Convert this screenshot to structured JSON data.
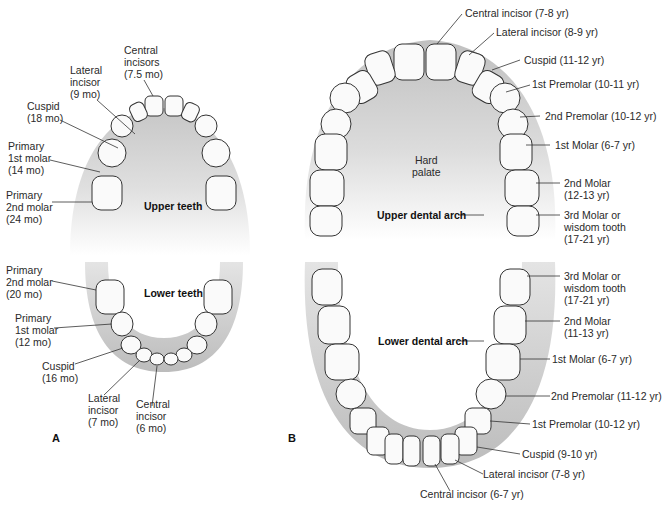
{
  "panel_a": {
    "letter": "A",
    "upper_title": "Upper teeth",
    "lower_title": "Lower teeth",
    "upper_labels": [
      {
        "name": "Central\nincisors\n(7.5 mo)"
      },
      {
        "name": "Lateral\nincisor\n(9 mo)"
      },
      {
        "name": "Cuspid\n(18 mo)"
      },
      {
        "name": "Primary\n1st molar\n(14 mo)"
      },
      {
        "name": "Primary\n2nd molar\n(24 mo)"
      }
    ],
    "lower_labels": [
      {
        "name": "Primary\n2nd molar\n(20 mo)"
      },
      {
        "name": "Primary\n1st molar\n(12 mo)"
      },
      {
        "name": "Cuspid\n(16 mo)"
      },
      {
        "name": "Lateral\nincisor\n(7 mo)"
      },
      {
        "name": "Central\nincisor\n(6 mo)"
      }
    ]
  },
  "panel_b": {
    "letter": "B",
    "hard_palate": "Hard\npalate",
    "upper_title": "Upper dental arch",
    "lower_title": "Lower dental arch",
    "upper_labels": [
      {
        "name": "Central incisor (7-8 yr)"
      },
      {
        "name": "Lateral incisor (8-9 yr)"
      },
      {
        "name": "Cuspid (11-12 yr)"
      },
      {
        "name": "1st Premolar (10-11 yr)"
      },
      {
        "name": "2nd Premolar (10-12 yr)"
      },
      {
        "name": "1st Molar (6-7 yr)"
      },
      {
        "name": "2nd Molar\n(12-13 yr)"
      },
      {
        "name": "3rd Molar or\nwisdom tooth\n(17-21 yr)"
      }
    ],
    "lower_labels": [
      {
        "name": "3rd Molar or\nwisdom tooth\n(17-21 yr)"
      },
      {
        "name": "2nd Molar\n(11-13 yr)"
      },
      {
        "name": "1st Molar (6-7 yr)"
      },
      {
        "name": "2nd Premolar (11-12 yr)"
      },
      {
        "name": "1st Premolar (10-12 yr)"
      },
      {
        "name": "Cuspid (9-10 yr)"
      },
      {
        "name": "Lateral incisor (7-8 yr)"
      },
      {
        "name": "Central incisor (6-7 yr)"
      }
    ]
  }
}
